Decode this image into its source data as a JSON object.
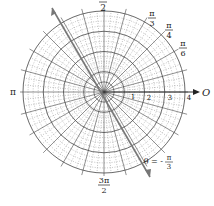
{
  "diagram": {
    "type": "polar-grid",
    "center": [
      104,
      92
    ],
    "outer_radius": 81,
    "radial_rings": 4,
    "sub_rings_per_unit": 4,
    "angle_spokes_deg": 15,
    "fine_spokes_deg": 5,
    "colors": {
      "grid": "#444444",
      "fine": "#888888",
      "ray": "#777777",
      "text": "#222222"
    }
  },
  "labels": {
    "angle_half_pi": {
      "num": "",
      "den": "2"
    },
    "angle_pi_3": {
      "num": "π",
      "den": "3"
    },
    "angle_pi_4": {
      "num": "π",
      "den": "4"
    },
    "angle_pi_6": {
      "num": "π",
      "den": "6"
    },
    "angle_pi": "π",
    "angle_3pi_2": {
      "num": "3π",
      "den": "2"
    },
    "origin_axis": "O",
    "radii": [
      "1",
      "2",
      "3",
      "4"
    ],
    "ray_eq": "θ = -",
    "ray_frac": {
      "num": "π",
      "den": "3"
    }
  }
}
